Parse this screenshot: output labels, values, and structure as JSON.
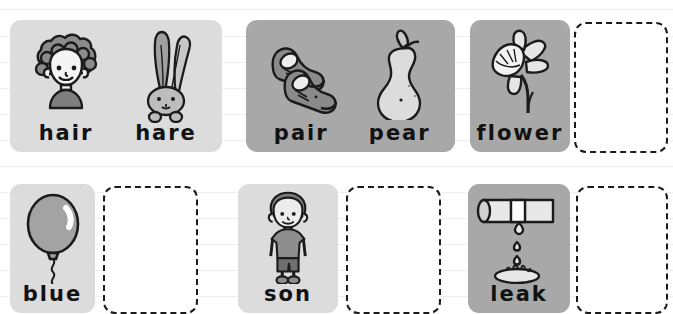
{
  "worksheet": {
    "background_color": "#ffffff",
    "rule_line_color": "#9196a0",
    "card_tone_light": "#dcdcdc",
    "card_tone_mid": "#a8a8a8",
    "word_color": "#121212",
    "dashed_box_color": "#1b1b1b",
    "rows": [
      {
        "groups": [
          {
            "tone": "light",
            "kind": "filled",
            "cells": [
              {
                "word": "hair",
                "icon": "curly-haired-child-icon"
              },
              {
                "word": "hare",
                "icon": "hare-rabbit-icon"
              }
            ]
          },
          {
            "tone": "mid",
            "kind": "filled",
            "cells": [
              {
                "word": "pair",
                "icon": "pair-of-shoes-icon"
              },
              {
                "word": "pear",
                "icon": "pear-fruit-icon"
              }
            ]
          },
          {
            "tone": "mid",
            "kind": "filled",
            "cells": [
              {
                "word": "flower",
                "icon": "daffodil-flower-icon"
              }
            ]
          },
          {
            "kind": "empty",
            "cells": [
              {
                "word": "",
                "icon": "empty-answer-box"
              }
            ]
          }
        ]
      },
      {
        "groups": [
          {
            "tone": "light",
            "kind": "filled",
            "cells": [
              {
                "word": "blue",
                "icon": "balloon-icon"
              }
            ]
          },
          {
            "kind": "empty",
            "cells": [
              {
                "word": "",
                "icon": "empty-answer-box"
              }
            ]
          },
          {
            "tone": "light",
            "kind": "filled",
            "cells": [
              {
                "word": "son",
                "icon": "boy-child-icon"
              }
            ]
          },
          {
            "kind": "empty",
            "cells": [
              {
                "word": "",
                "icon": "empty-answer-box"
              }
            ]
          },
          {
            "tone": "mid",
            "kind": "filled",
            "cells": [
              {
                "word": "leak",
                "icon": "leaking-pipe-icon"
              }
            ]
          },
          {
            "kind": "empty",
            "cells": [
              {
                "word": "",
                "icon": "empty-answer-box"
              }
            ]
          }
        ]
      }
    ]
  },
  "words": {
    "hair": "hair",
    "hare": "hare",
    "pair": "pair",
    "pear": "pear",
    "flower": "flower",
    "blue": "blue",
    "son": "son",
    "leak": "leak"
  }
}
